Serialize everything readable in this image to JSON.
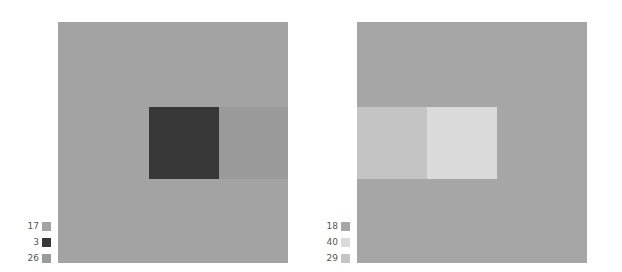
{
  "diagram": {
    "left_panel": {
      "background_color": "#a3a3a3",
      "square_color": "#383838",
      "band_color": "#9a9a9a",
      "legend": [
        {
          "label": "17",
          "color": "#a3a3a3"
        },
        {
          "label": "3",
          "color": "#383838"
        },
        {
          "label": "26",
          "color": "#9a9a9a"
        }
      ]
    },
    "right_panel": {
      "background_color": "#a6a6a6",
      "square_color": "#dadada",
      "band_color": "#c4c4c4",
      "legend": [
        {
          "label": "18",
          "color": "#a6a6a6"
        },
        {
          "label": "40",
          "color": "#dadada"
        },
        {
          "label": "29",
          "color": "#c4c4c4"
        }
      ]
    }
  }
}
